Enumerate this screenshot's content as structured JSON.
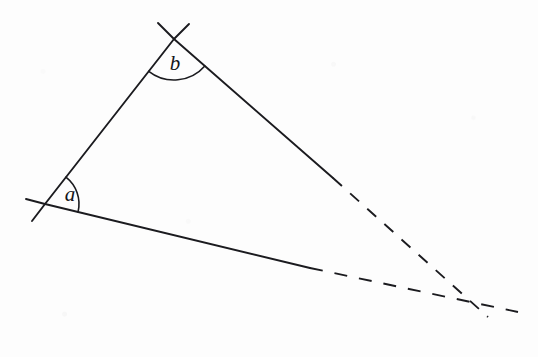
{
  "figure": {
    "background_color": "#fdfdfd",
    "stroke_color": "#1b1b1f",
    "width": 538,
    "height": 357,
    "labels": {
      "angle_a": "a",
      "angle_b": "b"
    },
    "vertices": {
      "a": {
        "x": 45,
        "y": 204
      },
      "b": {
        "x": 174,
        "y": 39
      },
      "convergence": {
        "x": 472,
        "y": 302
      }
    },
    "segments": [
      {
        "name": "upper-left-side",
        "style": "solid",
        "from": {
          "x": 45,
          "y": 204
        },
        "to": {
          "x": 174,
          "y": 39
        }
      },
      {
        "name": "upper-right-side-solid",
        "style": "solid",
        "from": {
          "x": 174,
          "y": 39
        },
        "to": {
          "x": 333,
          "y": 178
        }
      },
      {
        "name": "upper-right-side-dashed",
        "style": "dashed",
        "from": {
          "x": 333,
          "y": 178
        },
        "to": {
          "x": 488,
          "y": 317
        }
      },
      {
        "name": "base-side-solid",
        "style": "solid",
        "from": {
          "x": 45,
          "y": 204
        },
        "to": {
          "x": 310,
          "y": 268
        }
      },
      {
        "name": "base-side-dashed",
        "style": "dashed",
        "from": {
          "x": 310,
          "y": 268
        },
        "to": {
          "x": 518,
          "y": 312
        }
      },
      {
        "name": "tick-extension-below-a",
        "style": "solid",
        "from": {
          "x": 45,
          "y": 204
        },
        "to": {
          "x": 32,
          "y": 221
        }
      },
      {
        "name": "tick-extension-left-of-a",
        "style": "solid",
        "from": {
          "x": 45,
          "y": 204
        },
        "to": {
          "x": 26,
          "y": 199
        }
      },
      {
        "name": "tick-extension-above-b-left",
        "style": "solid",
        "from": {
          "x": 174,
          "y": 39
        },
        "to": {
          "x": 158,
          "y": 23
        }
      },
      {
        "name": "tick-extension-above-b-right",
        "style": "solid",
        "from": {
          "x": 174,
          "y": 39
        },
        "to": {
          "x": 189,
          "y": 24
        }
      }
    ],
    "arcs": [
      {
        "name": "angle-arc-a",
        "at": "a",
        "radius": 34
      },
      {
        "name": "angle-arc-b",
        "at": "b",
        "radius": 41
      }
    ],
    "label_positions": {
      "a": {
        "x": 70,
        "y": 201
      },
      "b": {
        "x": 175,
        "y": 70
      }
    }
  }
}
